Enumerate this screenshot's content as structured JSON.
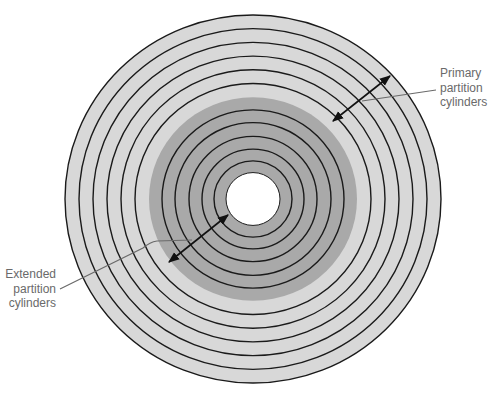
{
  "diagram": {
    "type": "disk-platter-partition-diagram",
    "disk": {
      "center": [
        253,
        199
      ],
      "ring_count_outer_primary": 6,
      "ring_count_inner_extended": 6,
      "outer_radius": 188,
      "hole_radius": 27
    },
    "colors": {
      "primary_fill": "#d8d8d8",
      "extended_fill": "#a9a9a9",
      "hole_fill": "#ffffff",
      "ring_stroke": "#1a1a1a",
      "arrow_stroke": "#111111",
      "leader_stroke": "#6a6a6a",
      "label_text": "#6a6a6a"
    },
    "labels": {
      "primary": [
        "Primary",
        "partition",
        "cylinders"
      ],
      "extended": [
        "Extended",
        "partition",
        "cylinders"
      ]
    }
  }
}
